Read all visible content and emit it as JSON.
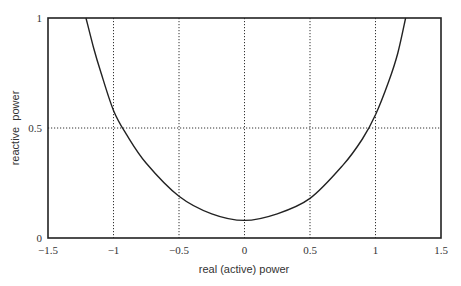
{
  "chart_data": {
    "type": "line",
    "title": "",
    "xlabel": "real (active) power",
    "ylabel": "reactive  power",
    "xlim": [
      -1.5,
      1.5
    ],
    "ylim": [
      0,
      1
    ],
    "x_ticks": [
      "-1.5",
      "-1",
      "-0.5",
      "0",
      "0.5",
      "1",
      "1.5"
    ],
    "y_ticks": [
      "0",
      "0.5",
      "1"
    ],
    "grid": {
      "vertical_dotted_at": [
        -1,
        -0.5,
        0,
        0.5,
        1
      ],
      "horizontal_dotted_at": [
        0.5
      ]
    },
    "legend": null,
    "series": [
      {
        "name": "curve",
        "x": [
          -1.21,
          -1.15,
          -1.1,
          -1.0,
          -0.9,
          -0.75,
          -0.5,
          -0.25,
          0,
          0.25,
          0.5,
          0.75,
          0.9,
          1.0,
          1.1,
          1.17,
          1.23
        ],
        "y": [
          1.0,
          0.86,
          0.76,
          0.58,
          0.47,
          0.34,
          0.19,
          0.11,
          0.08,
          0.11,
          0.18,
          0.33,
          0.45,
          0.56,
          0.71,
          0.84,
          1.0
        ]
      }
    ]
  },
  "colors": {
    "axis": "#222222",
    "curve": "#222222",
    "grid": "#333333"
  }
}
